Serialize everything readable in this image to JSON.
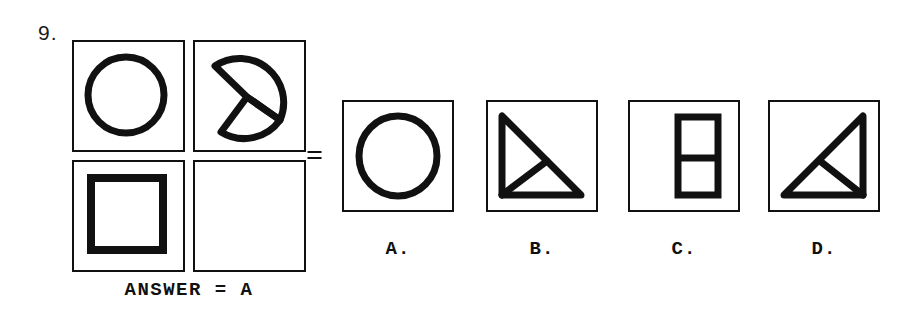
{
  "question": {
    "number": "9.",
    "equals": "=",
    "answer_caption": "ANSWER = A"
  },
  "matrix": {
    "cells": [
      {
        "position": "top-left",
        "figure": "circle",
        "empty": false
      },
      {
        "position": "top-right",
        "figure": "split-semicircle-rotated",
        "empty": false
      },
      {
        "position": "bottom-left",
        "figure": "square",
        "empty": false
      },
      {
        "position": "bottom-right",
        "figure": "blank",
        "empty": true
      }
    ]
  },
  "options": [
    {
      "id": "A",
      "label": "A.",
      "figure": "circle"
    },
    {
      "id": "B",
      "label": "B.",
      "figure": "right-triangle-top-left-split"
    },
    {
      "id": "C",
      "label": "C.",
      "figure": "vertical-rectangle-split"
    },
    {
      "id": "D",
      "label": "D.",
      "figure": "right-triangle-bottom-right-split"
    }
  ],
  "colors": {
    "ink": "#111111",
    "paper": "#ffffff"
  }
}
